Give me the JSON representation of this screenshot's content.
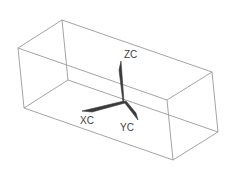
{
  "diagram": {
    "type": "wireframe-box-with-triad",
    "axes": {
      "z": {
        "label": "ZC"
      },
      "x": {
        "label": "XC"
      },
      "y": {
        "label": "YC"
      }
    },
    "colors": {
      "edges": "#9a9a9a",
      "axes": "#3a3a3a",
      "labels": "#404040"
    }
  }
}
